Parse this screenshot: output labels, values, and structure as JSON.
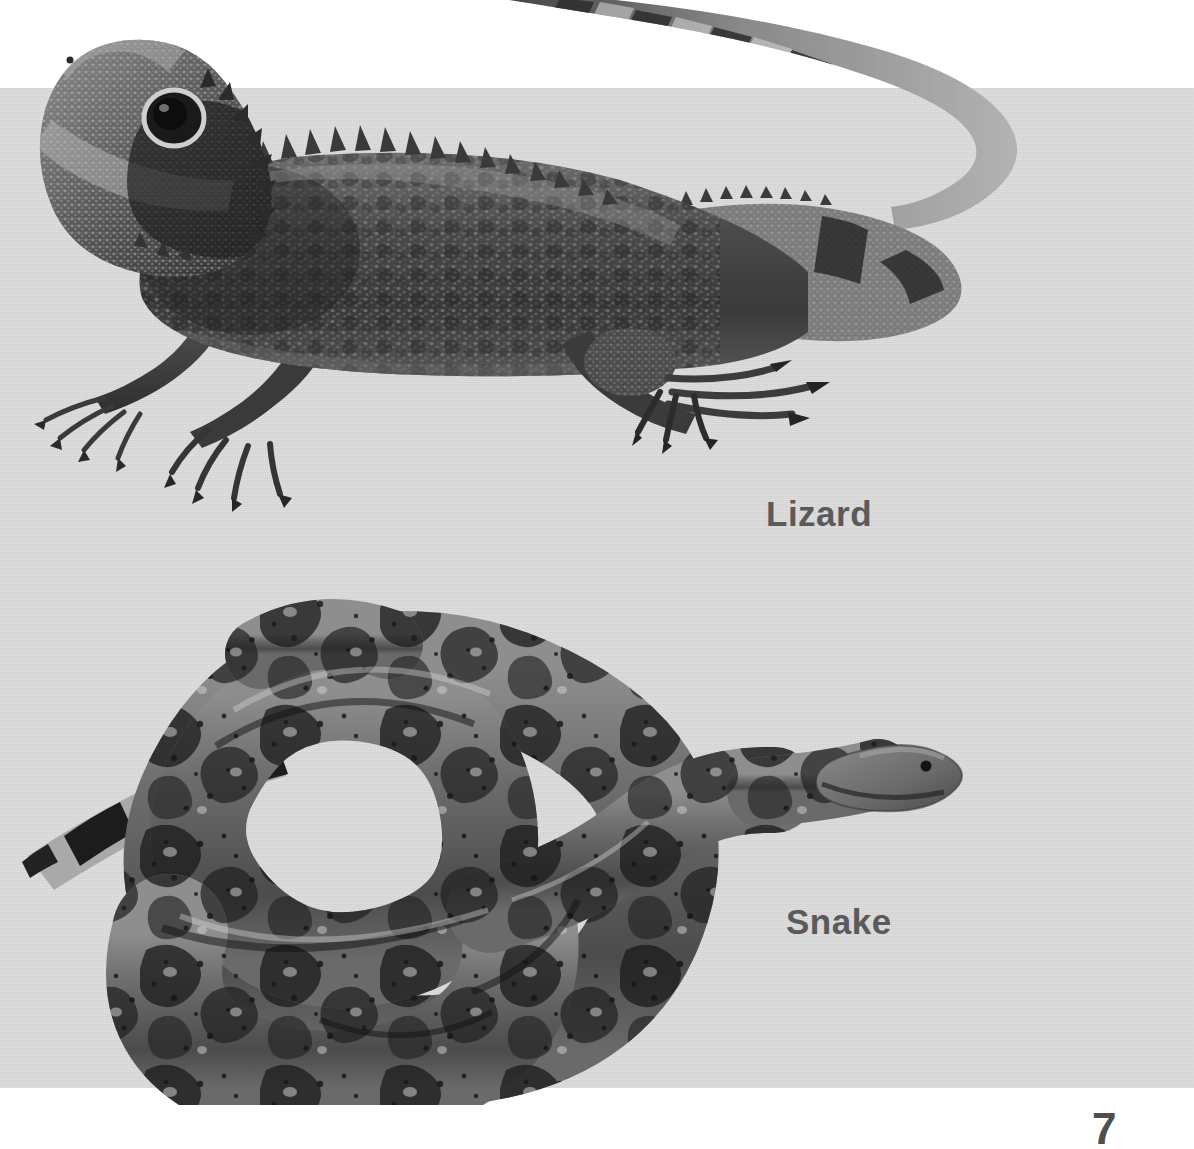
{
  "page": {
    "background_color": "#ffffff",
    "band_color": "#d9d9d9",
    "number": "7",
    "text_color": "#5a5a5a"
  },
  "figures": [
    {
      "id": "lizard",
      "caption": "Lizard",
      "alt": "grayscale photograph of a spiny water dragon lizard in profile facing left with long banded tail",
      "caption_x": 766,
      "caption_y": 494
    },
    {
      "id": "snake",
      "caption": "Snake",
      "alt": "grayscale photograph of a coiled boa constrictor snake with saddle blotch pattern, head at right",
      "caption_x": 786,
      "caption_y": 902
    }
  ],
  "captions": {
    "lizard": "Lizard",
    "snake": "Snake"
  }
}
